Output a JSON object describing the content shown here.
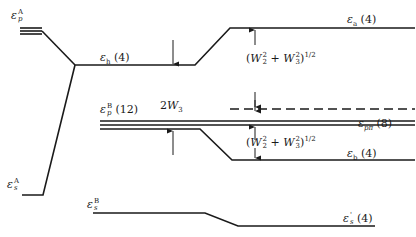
{
  "diagram": {
    "type": "energy-level correlation diagram",
    "levels": {
      "eps_p_A": {
        "symbol": "ε",
        "sup": "A",
        "sub": "p",
        "label": "ε_p^A"
      },
      "eps_s_A": {
        "symbol": "ε",
        "sup": "A",
        "sub": "s",
        "label": "ε_s^A"
      },
      "eps_h": {
        "symbol": "ε",
        "sub": "h",
        "degeneracy": "(4)",
        "label": "ε_h (4)"
      },
      "eps_p_B": {
        "symbol": "ε",
        "sup": "B",
        "sub": "p",
        "degeneracy": "(12)",
        "label": "ε_p^B (12)"
      },
      "eps_s_B": {
        "symbol": "ε",
        "sup": "B",
        "sub": "s",
        "label": "ε_s^B"
      },
      "eps_a": {
        "symbol": "ε",
        "sub": "a",
        "degeneracy": "(4)",
        "label": "ε_a (4)"
      },
      "eps_ppi": {
        "symbol": "ε",
        "sub": "pπ",
        "degeneracy": "(8)",
        "label": "ε_pπ (8)"
      },
      "eps_b": {
        "symbol": "ε",
        "sub": "b",
        "degeneracy": "(4)",
        "label": "ε_b (4)"
      },
      "eps_s_prime": {
        "symbol": "ε",
        "sup": "'",
        "sub": "s",
        "degeneracy": "(4)",
        "label": "ε_s' (4)"
      }
    },
    "annotations": {
      "gap_2w3": {
        "coef": "2",
        "var": "W",
        "sub": "3",
        "label": "2W_3"
      },
      "splitting_upper": {
        "open": "(",
        "w2": "W",
        "w2_sup": "2",
        "w2_sub": "2",
        "plus": " + ",
        "w3": "W",
        "w3_sup": "2",
        "w3_sub": "3",
        "close": ")",
        "power": "1/2",
        "label": "(W_2^2 + W_3^2)^1/2"
      },
      "splitting_lower": {
        "open": "(",
        "w2": "W",
        "w2_sup": "2",
        "w2_sub": "2",
        "plus": " + ",
        "w3": "W",
        "w3_sup": "2",
        "w3_sub": "3",
        "close": ")",
        "power": "1/2",
        "label": "(W_2^2 + W_3^2)^1/2"
      }
    },
    "line_color": "#1a1a1a"
  }
}
